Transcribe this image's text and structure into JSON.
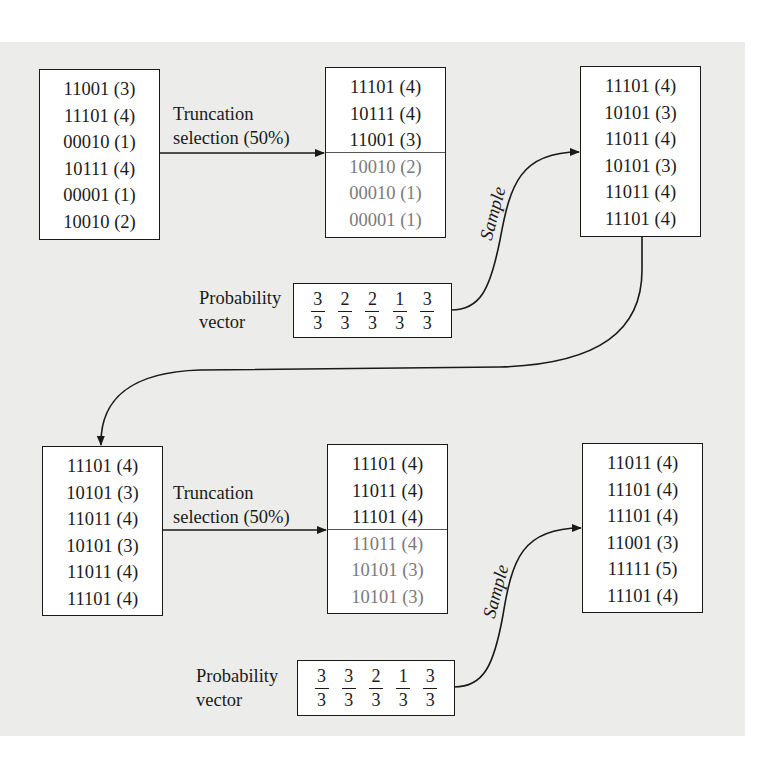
{
  "figure": {
    "background_color": "#ececea",
    "stroke_color": "#1a1a1a",
    "discarded_text_color": "#7a7a7a"
  },
  "generation_1": {
    "initial_population": {
      "individuals": [
        {
          "bits": "11001",
          "fitness": "(3)"
        },
        {
          "bits": "11101",
          "fitness": "(4)"
        },
        {
          "bits": "00010",
          "fitness": "(1)"
        },
        {
          "bits": "10111",
          "fitness": "(4)"
        },
        {
          "bits": "00001",
          "fitness": "(1)"
        },
        {
          "bits": "10010",
          "fitness": "(2)"
        }
      ]
    },
    "selection_label": {
      "line1": "Truncation",
      "line2": "selection (50%)"
    },
    "selected_population": {
      "kept": [
        {
          "bits": "11101",
          "fitness": "(4)"
        },
        {
          "bits": "10111",
          "fitness": "(4)"
        },
        {
          "bits": "11001",
          "fitness": "(3)"
        }
      ],
      "discarded": [
        {
          "bits": "10010",
          "fitness": "(2)"
        },
        {
          "bits": "00010",
          "fitness": "(1)"
        },
        {
          "bits": "00001",
          "fitness": "(1)"
        }
      ]
    },
    "probability_vector": {
      "label_line1": "Probability",
      "label_line2": "vector",
      "values": [
        {
          "num": "3",
          "den": "3"
        },
        {
          "num": "2",
          "den": "3"
        },
        {
          "num": "2",
          "den": "3"
        },
        {
          "num": "1",
          "den": "3"
        },
        {
          "num": "3",
          "den": "3"
        }
      ]
    },
    "sample_label": "Sample",
    "sampled_population": {
      "individuals": [
        {
          "bits": "11101",
          "fitness": "(4)"
        },
        {
          "bits": "10101",
          "fitness": "(3)"
        },
        {
          "bits": "11011",
          "fitness": "(4)"
        },
        {
          "bits": "10101",
          "fitness": "(3)"
        },
        {
          "bits": "11011",
          "fitness": "(4)"
        },
        {
          "bits": "11101",
          "fitness": "(4)"
        }
      ]
    }
  },
  "generation_2": {
    "initial_population": {
      "individuals": [
        {
          "bits": "11101",
          "fitness": "(4)"
        },
        {
          "bits": "10101",
          "fitness": "(3)"
        },
        {
          "bits": "11011",
          "fitness": "(4)"
        },
        {
          "bits": "10101",
          "fitness": "(3)"
        },
        {
          "bits": "11011",
          "fitness": "(4)"
        },
        {
          "bits": "11101",
          "fitness": "(4)"
        }
      ]
    },
    "selection_label": {
      "line1": "Truncation",
      "line2": "selection (50%)"
    },
    "selected_population": {
      "kept": [
        {
          "bits": "11101",
          "fitness": "(4)"
        },
        {
          "bits": "11011",
          "fitness": "(4)"
        },
        {
          "bits": "11101",
          "fitness": "(4)"
        }
      ],
      "discarded": [
        {
          "bits": "11011",
          "fitness": "(4)"
        },
        {
          "bits": "10101",
          "fitness": "(3)"
        },
        {
          "bits": "10101",
          "fitness": "(3)"
        }
      ]
    },
    "probability_vector": {
      "label_line1": "Probability",
      "label_line2": "vector",
      "values": [
        {
          "num": "3",
          "den": "3"
        },
        {
          "num": "3",
          "den": "3"
        },
        {
          "num": "2",
          "den": "3"
        },
        {
          "num": "1",
          "den": "3"
        },
        {
          "num": "3",
          "den": "3"
        }
      ]
    },
    "sample_label": "Sample",
    "sampled_population": {
      "individuals": [
        {
          "bits": "11011",
          "fitness": "(4)"
        },
        {
          "bits": "11101",
          "fitness": "(4)"
        },
        {
          "bits": "11101",
          "fitness": "(4)"
        },
        {
          "bits": "11001",
          "fitness": "(3)"
        },
        {
          "bits": "11111",
          "fitness": "(5)"
        },
        {
          "bits": "11101",
          "fitness": "(4)"
        }
      ]
    }
  }
}
